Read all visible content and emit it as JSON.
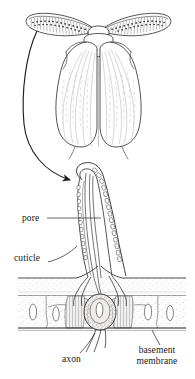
{
  "figure": {
    "background_color": "#ffffff",
    "ink_color": "#1f1f1f",
    "stipple_color": "#8f8f8f",
    "labels": {
      "pore": "pore",
      "cuticle": "cuticle",
      "axon": "axon",
      "basement_membrane_line1": "basement",
      "basement_membrane_line2": "membrane"
    },
    "caption_fragment": "",
    "panels": [
      {
        "name": "moth-habitus",
        "description": "dorsal view of a male moth with two large feathery antennae and folded wings"
      },
      {
        "name": "sensillum-section",
        "description": "longitudinal section of an olfactory sensillum showing pores, dendrites, receptor cell body, cuticle, epidermis and basement membrane"
      }
    ],
    "connector": {
      "name": "magnification-arrow",
      "from": "left antenna",
      "to": "sensillum tip"
    }
  }
}
